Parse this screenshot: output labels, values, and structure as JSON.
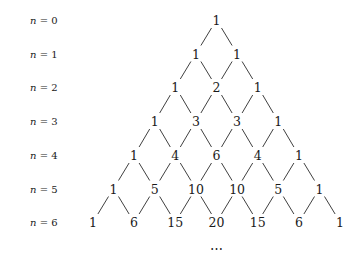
{
  "diagram": {
    "rows": [
      {
        "label_var": "n",
        "label_eq": " = ",
        "label_val": "0",
        "values": [
          1
        ]
      },
      {
        "label_var": "n",
        "label_eq": " = ",
        "label_val": "1",
        "values": [
          1,
          1
        ]
      },
      {
        "label_var": "n",
        "label_eq": " = ",
        "label_val": "2",
        "values": [
          1,
          2,
          1
        ]
      },
      {
        "label_var": "n",
        "label_eq": " = ",
        "label_val": "3",
        "values": [
          1,
          3,
          3,
          1
        ]
      },
      {
        "label_var": "n",
        "label_eq": " = ",
        "label_val": "4",
        "values": [
          1,
          4,
          6,
          4,
          1
        ]
      },
      {
        "label_var": "n",
        "label_eq": " = ",
        "label_val": "5",
        "values": [
          1,
          5,
          10,
          10,
          5,
          1
        ]
      },
      {
        "label_var": "n",
        "label_eq": " = ",
        "label_val": "6",
        "values": [
          1,
          6,
          15,
          20,
          15,
          6,
          1
        ]
      }
    ],
    "continuation": "⋯",
    "line_color": "#2a2a2a",
    "text_color": "#1a1a1a"
  }
}
